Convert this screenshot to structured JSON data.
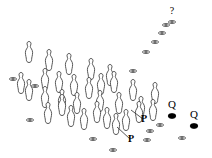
{
  "figure": {
    "canvas": {
      "width": 212,
      "height": 158,
      "background": "#ffffff"
    },
    "colors": {
      "outline": "#3a3a3a",
      "fill_open": "#ffffff",
      "fill_solid": "#000000",
      "leader": "#2b2b2b",
      "label": "#000000"
    }
  },
  "annotations": [
    {
      "id": "label-p-1",
      "text": "P",
      "x": 144,
      "y": 122
    },
    {
      "id": "label-p-2",
      "text": "P",
      "x": 131,
      "y": 142
    },
    {
      "id": "label-q-1",
      "text": "Q",
      "x": 172,
      "y": 108
    },
    {
      "id": "label-q-2",
      "text": "Q",
      "x": 194,
      "y": 118
    },
    {
      "id": "label-unknown",
      "text": "?",
      "x": 172,
      "y": 14
    }
  ],
  "upright_markers": [
    {
      "x": 29,
      "y": 52
    },
    {
      "x": 49,
      "y": 60
    },
    {
      "x": 69,
      "y": 64
    },
    {
      "x": 91,
      "y": 69
    },
    {
      "x": 110,
      "y": 75
    },
    {
      "x": 21,
      "y": 83
    },
    {
      "x": 45,
      "y": 79
    },
    {
      "x": 59,
      "y": 82
    },
    {
      "x": 74,
      "y": 85
    },
    {
      "x": 89,
      "y": 88
    },
    {
      "x": 101,
      "y": 84
    },
    {
      "x": 114,
      "y": 82
    },
    {
      "x": 133,
      "y": 90
    },
    {
      "x": 155,
      "y": 93
    },
    {
      "x": 45,
      "y": 97
    },
    {
      "x": 62,
      "y": 100
    },
    {
      "x": 77,
      "y": 103
    },
    {
      "x": 100,
      "y": 101
    },
    {
      "x": 119,
      "y": 103
    },
    {
      "x": 141,
      "y": 107
    },
    {
      "x": 153,
      "y": 110
    },
    {
      "x": 48,
      "y": 113
    },
    {
      "x": 71,
      "y": 116
    },
    {
      "x": 84,
      "y": 119
    },
    {
      "x": 107,
      "y": 118
    },
    {
      "x": 126,
      "y": 120
    },
    {
      "x": 139,
      "y": 112
    },
    {
      "x": 62,
      "y": 105
    },
    {
      "x": 97,
      "y": 112
    },
    {
      "x": 116,
      "y": 124
    },
    {
      "x": 29,
      "y": 90
    }
  ],
  "flat_open_markers": [
    {
      "x": 13,
      "y": 79
    },
    {
      "x": 35,
      "y": 86
    },
    {
      "x": 30,
      "y": 120
    },
    {
      "x": 93,
      "y": 139
    },
    {
      "x": 113,
      "y": 150
    },
    {
      "x": 147,
      "y": 140
    },
    {
      "x": 150,
      "y": 131
    },
    {
      "x": 160,
      "y": 125
    },
    {
      "x": 182,
      "y": 138
    },
    {
      "x": 133,
      "y": 71
    },
    {
      "x": 146,
      "y": 52
    },
    {
      "x": 155,
      "y": 42
    },
    {
      "x": 162,
      "y": 33
    },
    {
      "x": 166,
      "y": 25
    },
    {
      "x": 172,
      "y": 22
    }
  ],
  "flat_filled_markers": [
    {
      "x": 172,
      "y": 116
    },
    {
      "x": 194,
      "y": 126
    }
  ],
  "leaders": [
    {
      "id": "leader-p-1",
      "x1": 143,
      "y1": 119,
      "x2": 131,
      "y2": 110
    },
    {
      "id": "leader-p-2",
      "x1": 130,
      "y1": 139,
      "x2": 117,
      "y2": 127
    }
  ]
}
